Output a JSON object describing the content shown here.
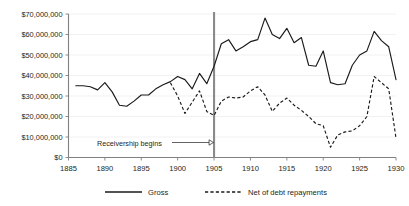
{
  "chart_data": {
    "type": "line",
    "title": "",
    "xlabel": "",
    "ylabel": "",
    "xlim": [
      1885,
      1930
    ],
    "ylim": [
      0,
      70000000
    ],
    "grid": true,
    "legend_position": "bottom",
    "y_tick_labels": [
      "$70,000,000",
      "$60,000,000",
      "$50,000,000",
      "$40,000,000",
      "$30,000,000",
      "$20,000,000",
      "$10,000,000",
      "$0"
    ],
    "y_tick_values": [
      70000000,
      60000000,
      50000000,
      40000000,
      30000000,
      20000000,
      10000000,
      0
    ],
    "x_tick_labels": [
      "1885",
      "1890",
      "1895",
      "1900",
      "1905",
      "1910",
      "1915",
      "1920",
      "1925",
      "1930"
    ],
    "x_tick_values": [
      1885,
      1890,
      1895,
      1900,
      1905,
      1910,
      1915,
      1920,
      1925,
      1930
    ],
    "annotations": [
      {
        "label": "Receivership begins",
        "x": 1905,
        "type": "vertical-line-with-arrow"
      }
    ],
    "series": [
      {
        "name": "Gross",
        "style": "solid",
        "color": "#1a1a1a",
        "x": [
          1886,
          1887,
          1888,
          1889,
          1890,
          1891,
          1892,
          1893,
          1894,
          1895,
          1896,
          1897,
          1898,
          1899,
          1900,
          1901,
          1902,
          1903,
          1904,
          1905,
          1906,
          1907,
          1908,
          1909,
          1910,
          1911,
          1912,
          1913,
          1914,
          1915,
          1916,
          1917,
          1918,
          1919,
          1920,
          1921,
          1922,
          1923,
          1924,
          1925,
          1926,
          1927,
          1928,
          1929,
          1930
        ],
        "values": [
          35000000,
          35000000,
          34500000,
          33000000,
          36500000,
          32000000,
          25500000,
          25000000,
          27500000,
          30500000,
          30500000,
          33500000,
          35500000,
          37000000,
          39500000,
          38000000,
          33500000,
          41000000,
          36000000,
          44500000,
          55500000,
          57500000,
          52000000,
          54000000,
          56500000,
          57500000,
          68000000,
          60000000,
          58000000,
          63000000,
          56000000,
          58500000,
          45000000,
          44500000,
          52000000,
          36500000,
          35500000,
          36000000,
          45000000,
          50000000,
          52000000,
          61500000,
          57000000,
          54000000,
          38000000
        ]
      },
      {
        "name": "Net of debt repayments",
        "style": "dashed",
        "color": "#1a1a1a",
        "x": [
          1899,
          1900,
          1901,
          1902,
          1903,
          1904,
          1905,
          1906,
          1907,
          1908,
          1909,
          1910,
          1911,
          1912,
          1913,
          1914,
          1915,
          1916,
          1917,
          1918,
          1919,
          1920,
          1921,
          1922,
          1923,
          1924,
          1925,
          1926,
          1927,
          1928,
          1929,
          1930
        ],
        "values": [
          36500000,
          30000000,
          21500000,
          27000000,
          32500000,
          22500000,
          20500000,
          27500000,
          29500000,
          29000000,
          29500000,
          32500000,
          34500000,
          30500000,
          22500000,
          26500000,
          29000000,
          25500000,
          23000000,
          20000000,
          16500000,
          15500000,
          5000000,
          11000000,
          12500000,
          13000000,
          15500000,
          20000000,
          39500000,
          36500000,
          33500000,
          9500000
        ]
      }
    ]
  },
  "legend": {
    "items": [
      {
        "label": "Gross",
        "style": "solid"
      },
      {
        "label": "Net of debt repayments",
        "style": "dashed"
      }
    ]
  }
}
